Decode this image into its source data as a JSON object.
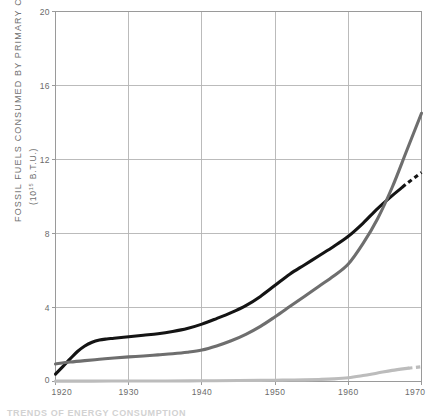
{
  "figure": {
    "background_color": "#ffffff",
    "frame_color": "#9a9a9a",
    "grid_color": "#b4b4b4",
    "caption_partial": "TRENDS OF ENERGY CONSUMPTION"
  },
  "axis_labels": {
    "y_title": "FOSSIL FUELS CONSUMED BY PRIMARY CONVERTERS, U.S.",
    "y_units_prefix": "(10",
    "y_units_exponent": "15",
    "y_units_suffix": " B.T.U.)",
    "y_ticks": [
      "0",
      "4",
      "8",
      "12",
      "16",
      "20"
    ],
    "x_ticks": [
      "1920",
      "1930",
      "1940",
      "1950",
      "1960",
      "1970"
    ]
  },
  "chart_data": {
    "type": "line",
    "title": "",
    "subtitle": "",
    "xlabel": "",
    "ylabel": "FOSSIL FUELS CONSUMED BY PRIMARY CONVERTERS, U.S. (10^15 B.T.U.)",
    "xlim": [
      1920,
      1970
    ],
    "ylim": [
      0,
      20
    ],
    "xticks": [
      1920,
      1930,
      1940,
      1950,
      1960,
      1970
    ],
    "yticks": [
      0,
      4,
      8,
      12,
      16,
      20
    ],
    "grid": true,
    "legend": "none",
    "legend_position": "none",
    "annotations": [
      "Dashed tail segments on black and light-gray series indicate projected/estimated values near 1970",
      "Dark-gray series overtakes black series near 1965"
    ],
    "series": [
      {
        "name": "Black series",
        "color": "#141414",
        "width": 3.1,
        "dash_from_x": 1967.4,
        "x": [
          1920,
          1921,
          1922,
          1923,
          1924,
          1925,
          1926,
          1927,
          1928,
          1930,
          1932,
          1934,
          1936,
          1938,
          1940,
          1942,
          1944,
          1946,
          1948,
          1950,
          1952,
          1954,
          1956,
          1958,
          1960,
          1962,
          1964,
          1966,
          1968,
          1970
        ],
        "y": [
          0.4,
          0.8,
          1.22,
          1.62,
          1.92,
          2.12,
          2.24,
          2.3,
          2.34,
          2.42,
          2.5,
          2.58,
          2.7,
          2.86,
          3.1,
          3.4,
          3.72,
          4.1,
          4.6,
          5.2,
          5.8,
          6.3,
          6.8,
          7.3,
          7.85,
          8.55,
          9.35,
          10.05,
          10.7,
          11.3
        ]
      },
      {
        "name": "Dark gray series",
        "color": "#6e6e6e",
        "width": 3.1,
        "dash_from_x": null,
        "x": [
          1920,
          1922,
          1924,
          1926,
          1928,
          1930,
          1932,
          1934,
          1936,
          1938,
          1940,
          1942,
          1944,
          1946,
          1948,
          1950,
          1952,
          1954,
          1956,
          1958,
          1960,
          1962,
          1964,
          1966,
          1968,
          1970
        ],
        "y": [
          0.95,
          1.05,
          1.13,
          1.2,
          1.27,
          1.33,
          1.38,
          1.44,
          1.5,
          1.58,
          1.7,
          1.92,
          2.2,
          2.55,
          2.98,
          3.5,
          4.05,
          4.6,
          5.15,
          5.7,
          6.35,
          7.45,
          8.8,
          10.5,
          12.5,
          14.5
        ]
      },
      {
        "name": "Light gray series",
        "color": "#bcbcbc",
        "width": 3.1,
        "dash_from_x": 1968.2,
        "x": [
          1920,
          1925,
          1930,
          1935,
          1940,
          1945,
          1948,
          1950,
          1952,
          1954,
          1956,
          1958,
          1960,
          1962,
          1964,
          1966,
          1968,
          1970
        ],
        "y": [
          0.02,
          0.02,
          0.03,
          0.03,
          0.04,
          0.05,
          0.06,
          0.07,
          0.08,
          0.09,
          0.11,
          0.14,
          0.2,
          0.32,
          0.46,
          0.6,
          0.71,
          0.8
        ]
      }
    ]
  }
}
